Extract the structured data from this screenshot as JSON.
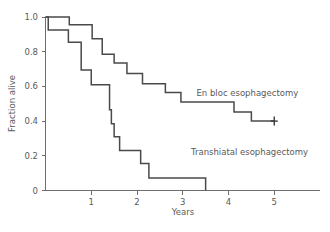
{
  "chart_data": {
    "type": "line",
    "subtype": "kaplan-meier-step",
    "title": "",
    "xlabel": "Years",
    "ylabel": "Fraction alive",
    "xlim": [
      0,
      5.6
    ],
    "ylim": [
      0,
      1.0
    ],
    "xticks": [
      1,
      2,
      3,
      4,
      5
    ],
    "xticklabels": [
      "1",
      "2",
      "3",
      "4",
      "5"
    ],
    "yticks": [
      0,
      0.2,
      0.4,
      0.6,
      0.8,
      1.0
    ],
    "yticklabels": [
      "0",
      "0.2",
      "0.4",
      "0.6",
      "0.8",
      "1.0"
    ],
    "grid": false,
    "legend_position": "inline-annotation",
    "line_color": "#4a4a4a",
    "axis_color": "#6e6e6e",
    "text_color": "#5a5a5a",
    "series": [
      {
        "name": "En bloc esophagectomy",
        "label": "En bloc esophagectomy",
        "label_x": 3.3,
        "label_y": 0.545,
        "censor_marks": [
          {
            "x": 5.0,
            "y": 0.4
          }
        ],
        "points": [
          {
            "x": 0.0,
            "y": 1.0
          },
          {
            "x": 0.52,
            "y": 1.0
          },
          {
            "x": 0.52,
            "y": 0.955
          },
          {
            "x": 1.02,
            "y": 0.955
          },
          {
            "x": 1.02,
            "y": 0.875
          },
          {
            "x": 1.24,
            "y": 0.875
          },
          {
            "x": 1.24,
            "y": 0.785
          },
          {
            "x": 1.5,
            "y": 0.785
          },
          {
            "x": 1.5,
            "y": 0.735
          },
          {
            "x": 1.78,
            "y": 0.735
          },
          {
            "x": 1.78,
            "y": 0.675
          },
          {
            "x": 2.12,
            "y": 0.675
          },
          {
            "x": 2.12,
            "y": 0.615
          },
          {
            "x": 2.62,
            "y": 0.615
          },
          {
            "x": 2.62,
            "y": 0.565
          },
          {
            "x": 2.96,
            "y": 0.565
          },
          {
            "x": 2.96,
            "y": 0.51
          },
          {
            "x": 4.12,
            "y": 0.51
          },
          {
            "x": 4.12,
            "y": 0.452
          },
          {
            "x": 4.5,
            "y": 0.452
          },
          {
            "x": 4.5,
            "y": 0.4
          },
          {
            "x": 5.0,
            "y": 0.4
          }
        ]
      },
      {
        "name": "Transhiatal esophagectomy",
        "label": "Transhiatal esophagectomy",
        "label_x": 3.18,
        "label_y": 0.205,
        "censor_marks": [],
        "points": [
          {
            "x": 0.0,
            "y": 1.0
          },
          {
            "x": 0.06,
            "y": 1.0
          },
          {
            "x": 0.06,
            "y": 0.925
          },
          {
            "x": 0.5,
            "y": 0.925
          },
          {
            "x": 0.5,
            "y": 0.855
          },
          {
            "x": 0.78,
            "y": 0.855
          },
          {
            "x": 0.78,
            "y": 0.695
          },
          {
            "x": 1.0,
            "y": 0.695
          },
          {
            "x": 1.0,
            "y": 0.61
          },
          {
            "x": 1.4,
            "y": 0.61
          },
          {
            "x": 1.4,
            "y": 0.465
          },
          {
            "x": 1.44,
            "y": 0.465
          },
          {
            "x": 1.44,
            "y": 0.385
          },
          {
            "x": 1.5,
            "y": 0.385
          },
          {
            "x": 1.5,
            "y": 0.31
          },
          {
            "x": 1.62,
            "y": 0.31
          },
          {
            "x": 1.62,
            "y": 0.23
          },
          {
            "x": 2.08,
            "y": 0.23
          },
          {
            "x": 2.08,
            "y": 0.155
          },
          {
            "x": 2.26,
            "y": 0.155
          },
          {
            "x": 2.26,
            "y": 0.072
          },
          {
            "x": 3.5,
            "y": 0.072
          },
          {
            "x": 3.5,
            "y": 0.0
          }
        ]
      }
    ]
  }
}
